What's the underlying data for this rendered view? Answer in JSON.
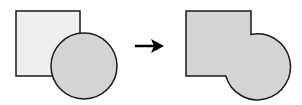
{
  "diagram": {
    "colors": {
      "square_fill": "#efefef",
      "circle_fill": "#d4d4d4",
      "merged_fill": "#d4d4d4",
      "stroke": "#1a1a1a",
      "arrow": "#000000"
    },
    "before": {
      "square": {
        "x": 16,
        "y": 11,
        "w": 64,
        "h": 65
      },
      "circle": {
        "cx": 84,
        "cy": 66,
        "r": 33
      }
    },
    "arrow": {
      "x1": 135,
      "x2": 164,
      "y": 46
    },
    "after": {
      "square": {
        "x": 186,
        "y": 11,
        "w": 65,
        "h": 65
      },
      "circle": {
        "cx": 254,
        "cy": 66,
        "r": 33
      }
    }
  }
}
